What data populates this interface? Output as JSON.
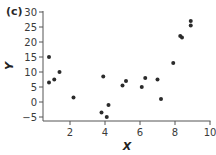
{
  "panel_label": "(c)",
  "colors": {
    "axis": "#555555",
    "point": "#2b2b2b",
    "text": "#3a3a3a"
  },
  "chart_data": {
    "type": "scatter",
    "title": "",
    "panel": "(c)",
    "xlabel": "X",
    "ylabel": "Y",
    "xlim": [
      0,
      10
    ],
    "ylim": [
      -5,
      30
    ],
    "xticks": [
      2,
      4,
      6,
      8,
      10
    ],
    "yticks": [
      -5,
      0,
      5,
      10,
      15,
      20,
      25,
      30
    ],
    "grid": false,
    "legend": null,
    "points": [
      {
        "x": 0.8,
        "y": 15
      },
      {
        "x": 0.8,
        "y": 6.5
      },
      {
        "x": 1.1,
        "y": 7.5
      },
      {
        "x": 1.4,
        "y": 10
      },
      {
        "x": 2.2,
        "y": 1.5
      },
      {
        "x": 3.8,
        "y": -3.5
      },
      {
        "x": 3.9,
        "y": 8.5
      },
      {
        "x": 4.1,
        "y": -5
      },
      {
        "x": 4.2,
        "y": -1
      },
      {
        "x": 5.0,
        "y": 5.5
      },
      {
        "x": 5.2,
        "y": 7
      },
      {
        "x": 6.1,
        "y": 5
      },
      {
        "x": 6.3,
        "y": 8
      },
      {
        "x": 7.0,
        "y": 7.5
      },
      {
        "x": 7.2,
        "y": 1
      },
      {
        "x": 7.9,
        "y": 13
      },
      {
        "x": 8.3,
        "y": 22
      },
      {
        "x": 8.4,
        "y": 21.5
      },
      {
        "x": 8.9,
        "y": 25.5
      },
      {
        "x": 8.9,
        "y": 27
      }
    ]
  }
}
